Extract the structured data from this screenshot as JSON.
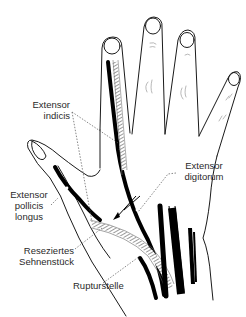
{
  "figure": {
    "colors": {
      "outline": "#1a1a1a",
      "tendon": "#000000",
      "hatch": "#666666",
      "leader": "#555555",
      "background": "#ffffff"
    }
  },
  "labels": {
    "extensor_indicis": {
      "line1": "Extensor",
      "line2": "indicis"
    },
    "extensor_digitorum": {
      "line1": "Extensor",
      "line2": "digitorum"
    },
    "extensor_pollicis_longus": {
      "line1": "Extensor",
      "line2": "pollicis",
      "line3": "longus"
    },
    "reseziertes_sehnenstueck": {
      "line1": "Reseziertes",
      "line2": "Sehnenstück"
    },
    "rupturstelle": {
      "line1": "Rupturstelle"
    }
  }
}
